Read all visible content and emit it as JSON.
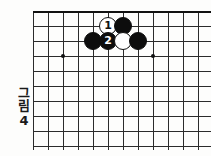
{
  "figure": {
    "caption_chars": [
      "그",
      "림"
    ],
    "caption_number": "4",
    "caption_full": "그림 4"
  },
  "board": {
    "type": "go-board-diagram",
    "columns": 12,
    "rows": 9,
    "cell_size": 15,
    "origin": {
      "x": 33,
      "y": 11
    },
    "top_edge": true,
    "right_edge": true,
    "bottom_cut_off": true,
    "left_cut_off": true,
    "line_color": "#2b2b2b",
    "edge_color": "#111111",
    "background": "#fdfdfc",
    "star_points": [
      {
        "col": 2,
        "row": 3
      },
      {
        "col": 8,
        "row": 3
      }
    ],
    "stones": [
      {
        "col": 5,
        "row": 1,
        "color": "white",
        "label": "1",
        "name": "white-stone-1"
      },
      {
        "col": 6,
        "row": 1,
        "color": "black",
        "label": "",
        "name": "black-stone-a"
      },
      {
        "col": 4,
        "row": 2,
        "color": "black",
        "label": "",
        "name": "black-stone-b"
      },
      {
        "col": 5,
        "row": 2,
        "color": "black",
        "label": "2",
        "name": "black-stone-2"
      },
      {
        "col": 6,
        "row": 2,
        "color": "white",
        "label": "",
        "name": "white-stone-c"
      },
      {
        "col": 7,
        "row": 2,
        "color": "black",
        "label": "",
        "name": "black-stone-d"
      }
    ]
  }
}
